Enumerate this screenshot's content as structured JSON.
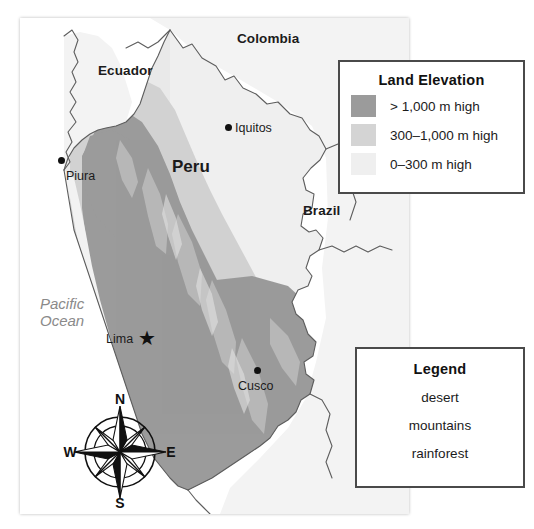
{
  "map": {
    "title_area": "Map of Peru showing land elevation",
    "countries": [
      {
        "name": "Ecuador",
        "x": 78,
        "y": 52
      },
      {
        "name": "Colombia",
        "x": 235,
        "y": 30
      },
      {
        "name": "Peru",
        "x": 172,
        "y": 166
      },
      {
        "name": "Brazil",
        "x": 302,
        "y": 210
      }
    ],
    "ocean_label": "Pacific\nOcean",
    "ocean_label_line1": "Pacific",
    "ocean_label_line2": "Ocean",
    "cities": [
      {
        "name": "Piura",
        "marker": "dot",
        "label_x": 52,
        "label_y": 180,
        "dot_x": 57,
        "dot_y": 163
      },
      {
        "name": "Iquitos",
        "marker": "dot",
        "label_x": 235,
        "label_y": 127,
        "dot_x": 224,
        "dot_y": 125
      },
      {
        "name": "Lima",
        "marker": "star",
        "label_x": 107,
        "label_y": 339,
        "dot_x": 137,
        "dot_y": 332
      },
      {
        "name": "Cusco",
        "marker": "dot",
        "label_x": 240,
        "label_y": 388,
        "dot_x": 254,
        "dot_y": 371
      }
    ],
    "compass": {
      "north": "N",
      "south": "S",
      "east": "E",
      "west": "W"
    },
    "colors": {
      "ocean": "#ffffff",
      "land_low": "#ededed",
      "land_mid": "#d2d2d2",
      "land_high": "#9b9b9b",
      "border_line": "#5d5d5d",
      "ocean_text": "#8a8a8a",
      "box_border": "#4a4a4a"
    }
  },
  "land_elevation": {
    "title": "Land Elevation",
    "rows": [
      {
        "label": "> 1,000 m high",
        "color": "#9b9b9b"
      },
      {
        "label": "300–1,000 m high",
        "color": "#d4d4d4"
      },
      {
        "label": "0–300 m high",
        "color": "#efefef"
      }
    ]
  },
  "legend": {
    "title": "Legend",
    "entries": [
      {
        "label": "desert"
      },
      {
        "label": "mountains"
      },
      {
        "label": "rainforest"
      }
    ]
  }
}
